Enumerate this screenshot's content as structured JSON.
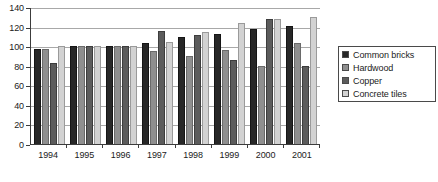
{
  "chart_data": {
    "type": "bar",
    "title": "",
    "subtitle": "",
    "xlabel": "",
    "ylabel": "",
    "ylim": [
      0,
      140
    ],
    "yticks": [
      0,
      20,
      40,
      60,
      80,
      100,
      120,
      140
    ],
    "grid": true,
    "legend_position": "right",
    "categories": [
      "1994",
      "1995",
      "1996",
      "1997",
      "1998",
      "1999",
      "2000",
      "2001"
    ],
    "series": [
      {
        "name": "Common bricks",
        "color": "#272727",
        "values": [
          97,
          100,
          100,
          103,
          109,
          112,
          118,
          121
        ]
      },
      {
        "name": "Hardwood",
        "color": "#8f8f8f",
        "values": [
          97,
          100,
          100,
          95,
          90,
          96,
          80,
          103
        ]
      },
      {
        "name": "Copper",
        "color": "#5c5c5c",
        "values": [
          83,
          100,
          100,
          116,
          111,
          86,
          128,
          80
        ]
      },
      {
        "name": "Concrete tiles",
        "color": "#d2d2d2",
        "values": [
          100,
          100,
          100,
          104,
          114,
          124,
          128,
          130
        ]
      }
    ]
  },
  "legend": {
    "items": [
      {
        "label": "Common bricks"
      },
      {
        "label": "Hardwood"
      },
      {
        "label": "Copper"
      },
      {
        "label": "Concrete tiles"
      }
    ]
  },
  "caption": {
    "text": ""
  }
}
